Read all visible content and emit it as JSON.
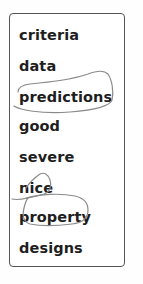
{
  "word_list": {
    "items": [
      {
        "label": "criteria",
        "circled": false
      },
      {
        "label": "data",
        "circled": false
      },
      {
        "label": "predictions",
        "circled": true
      },
      {
        "label": "good",
        "circled": false
      },
      {
        "label": "severe",
        "circled": false
      },
      {
        "label": "nice",
        "circled": true
      },
      {
        "label": "property",
        "circled": true
      },
      {
        "label": "designs",
        "circled": false
      }
    ]
  },
  "colors": {
    "text": "#1e1e1e",
    "box_border": "#555555",
    "annotation_stroke": "#8a8a8a"
  }
}
